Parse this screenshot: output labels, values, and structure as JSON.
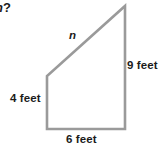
{
  "figure": {
    "type": "right-trapezoid",
    "stroke_color": "#9a9a9a",
    "fill_color": "#ffffff",
    "text_color": "#1b1b1b",
    "question_fragment_italic": "n",
    "question_fragment_mark": "?",
    "labels": {
      "hypotenuse": "n",
      "right_side": "9 feet",
      "left_side": "4 feet",
      "base": "6 feet"
    },
    "vertices": {
      "bottom_left": [
        47,
        129
      ],
      "top_left": [
        47,
        76
      ],
      "apex": [
        125,
        6
      ],
      "bottom_right": [
        125,
        129
      ]
    },
    "measurements": {
      "left_side_value": 4,
      "right_side_value": 9,
      "base_value": 6,
      "unit": "feet",
      "unknown_side": "n"
    }
  }
}
